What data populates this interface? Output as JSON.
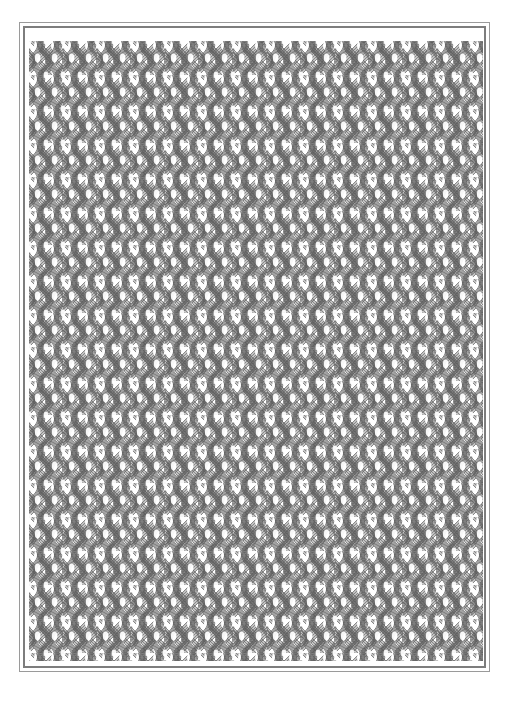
{
  "plate": {
    "title": "Ornamental Interlace Pattern Plate",
    "medium": "engraved line ornament",
    "background_color": "#ffffff",
    "width_px": 512,
    "height_px": 704
  },
  "frame": {
    "style": "double ruled rectangle",
    "outer_rule_color": "#9a9a9a",
    "outer_rule_width_px": 1,
    "inner_rule_color": "#7d7d7d",
    "inner_rule_width_px": 2,
    "outer_left_px": 19,
    "outer_top_px": 22,
    "outer_width_px": 471,
    "outer_height_px": 650
  },
  "pattern": {
    "name": "interlaced hatched lattice",
    "description": "Dense all-over repeat of crossing hatched line-bundles forming X junctions with white hourglass negative shapes",
    "motif_name": "hourglass-interlace-motif",
    "unit_cell_width_px": 34,
    "unit_cell_height_px": 34,
    "columns": 14,
    "rows": 19,
    "line_color": "#5c5c5c",
    "line_color_light": "#8f8f8f",
    "hatch_color": "#7a7a7a",
    "negative_space_color": "#ffffff",
    "strands_per_bundle": 7,
    "bundle_width_px": 9,
    "stroke_width_px": 0.85,
    "field_left_px": 29,
    "field_top_px": 41,
    "field_width_px": 454,
    "field_height_px": 620
  }
}
